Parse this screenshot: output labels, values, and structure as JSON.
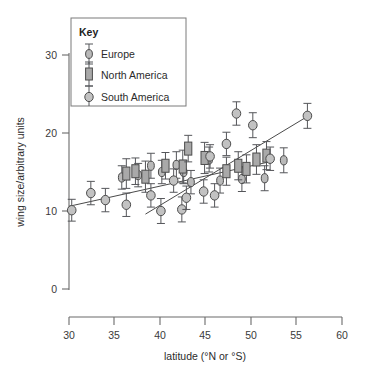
{
  "chart_data": {
    "type": "scatter",
    "title": "",
    "xlabel": "latitude (°N or °S)",
    "ylabel": "wing size/arbitrary units",
    "xlim": [
      30,
      60
    ],
    "ylim": [
      0,
      30
    ],
    "xticks": [
      30,
      35,
      40,
      45,
      50,
      55,
      60
    ],
    "yticks": [
      0,
      10,
      20,
      30
    ],
    "grid": false,
    "legend_position": "top-left",
    "legend_title": "Key",
    "series": [
      {
        "name": "Europe",
        "marker": "small-circle",
        "points": [
          {
            "x": 35.8,
            "y": 14.3,
            "err": 1.5
          },
          {
            "x": 37.6,
            "y": 14.6,
            "err": 1.5
          },
          {
            "x": 39.0,
            "y": 15.8,
            "err": 1.6
          },
          {
            "x": 40.2,
            "y": 15.0,
            "err": 1.5
          },
          {
            "x": 41.8,
            "y": 15.9,
            "err": 1.7
          },
          {
            "x": 42.6,
            "y": 15.0,
            "err": 1.5
          },
          {
            "x": 43.4,
            "y": 13.7,
            "err": 1.5
          },
          {
            "x": 45.4,
            "y": 16.6,
            "err": 1.6
          },
          {
            "x": 46.6,
            "y": 13.9,
            "err": 1.6
          },
          {
            "x": 49.0,
            "y": 14.1,
            "err": 1.6
          },
          {
            "x": 51.5,
            "y": 14.2,
            "err": 1.6
          },
          {
            "x": 53.6,
            "y": 16.5,
            "err": 1.6
          }
        ]
      },
      {
        "name": "North America",
        "marker": "square",
        "points": [
          {
            "x": 36.3,
            "y": 14.8,
            "err": 1.9
          },
          {
            "x": 37.3,
            "y": 15.1,
            "err": 1.7
          },
          {
            "x": 38.4,
            "y": 14.4,
            "err": 2.0
          },
          {
            "x": 40.6,
            "y": 15.8,
            "err": 1.7
          },
          {
            "x": 42.5,
            "y": 15.7,
            "err": 2.1
          },
          {
            "x": 43.1,
            "y": 18.0,
            "err": 1.7
          },
          {
            "x": 44.9,
            "y": 16.8,
            "err": 2.0
          },
          {
            "x": 47.3,
            "y": 15.1,
            "err": 1.8
          },
          {
            "x": 48.6,
            "y": 15.8,
            "err": 1.8
          },
          {
            "x": 49.5,
            "y": 15.4,
            "err": 1.8
          },
          {
            "x": 50.6,
            "y": 16.6,
            "err": 1.9
          },
          {
            "x": 51.7,
            "y": 17.1,
            "err": 1.8
          }
        ]
      },
      {
        "name": "South America",
        "marker": "large-circle",
        "points": [
          {
            "x": 30.3,
            "y": 10.1,
            "err": 1.4
          },
          {
            "x": 32.4,
            "y": 12.3,
            "err": 1.5
          },
          {
            "x": 34.0,
            "y": 11.4,
            "err": 1.5
          },
          {
            "x": 36.3,
            "y": 10.8,
            "err": 1.5
          },
          {
            "x": 39.0,
            "y": 12.0,
            "err": 1.5
          },
          {
            "x": 40.1,
            "y": 10.0,
            "err": 1.6
          },
          {
            "x": 41.5,
            "y": 13.9,
            "err": 1.5
          },
          {
            "x": 42.4,
            "y": 10.2,
            "err": 1.6
          },
          {
            "x": 42.9,
            "y": 11.7,
            "err": 1.5
          },
          {
            "x": 44.8,
            "y": 12.5,
            "err": 1.5
          },
          {
            "x": 45.5,
            "y": 17.0,
            "err": 1.5
          },
          {
            "x": 46.0,
            "y": 12.0,
            "err": 1.5
          },
          {
            "x": 47.3,
            "y": 18.6,
            "err": 1.5
          },
          {
            "x": 48.4,
            "y": 22.5,
            "err": 1.5
          },
          {
            "x": 50.2,
            "y": 21.0,
            "err": 1.6
          },
          {
            "x": 52.1,
            "y": 16.7,
            "err": 1.5
          },
          {
            "x": 56.2,
            "y": 22.2,
            "err": 1.6
          }
        ]
      }
    ],
    "trendlines": [
      {
        "name": "shallow-trend",
        "x1": 30.0,
        "y1": 10.6,
        "x2": 52.4,
        "y2": 16.4
      },
      {
        "name": "steep-trend",
        "x1": 38.4,
        "y1": 9.6,
        "x2": 56.6,
        "y2": 22.4
      }
    ]
  }
}
